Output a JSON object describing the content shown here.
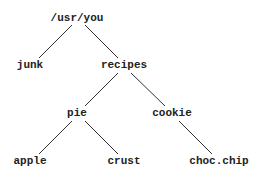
{
  "diagram": {
    "type": "tree",
    "colors": {
      "text": "#222222",
      "edge": "#333333",
      "background": "#ffffff"
    },
    "nodes": [
      {
        "id": "root",
        "label": "/usr/you",
        "x": 77,
        "y": 21
      },
      {
        "id": "junk",
        "label": "junk",
        "x": 30,
        "y": 68
      },
      {
        "id": "recipes",
        "label": "recipes",
        "x": 124,
        "y": 68
      },
      {
        "id": "pie",
        "label": "pie",
        "x": 77,
        "y": 116
      },
      {
        "id": "cookie",
        "label": "cookie",
        "x": 172,
        "y": 116
      },
      {
        "id": "apple",
        "label": "apple",
        "x": 30,
        "y": 164
      },
      {
        "id": "crust",
        "label": "crust",
        "x": 124,
        "y": 164
      },
      {
        "id": "chocchip",
        "label": "choc.chip",
        "x": 219,
        "y": 164
      }
    ],
    "edges": [
      {
        "from": "root",
        "to": "junk",
        "x1": 72,
        "y1": 25,
        "x2": 39,
        "y2": 58
      },
      {
        "from": "root",
        "to": "recipes",
        "x1": 85,
        "y1": 25,
        "x2": 118,
        "y2": 58
      },
      {
        "from": "recipes",
        "to": "pie",
        "x1": 118,
        "y1": 73,
        "x2": 85,
        "y2": 106
      },
      {
        "from": "recipes",
        "to": "cookie",
        "x1": 131,
        "y1": 73,
        "x2": 165,
        "y2": 106
      },
      {
        "from": "pie",
        "to": "apple",
        "x1": 72,
        "y1": 121,
        "x2": 39,
        "y2": 154
      },
      {
        "from": "pie",
        "to": "crust",
        "x1": 85,
        "y1": 121,
        "x2": 118,
        "y2": 154
      },
      {
        "from": "cookie",
        "to": "chocchip",
        "x1": 179,
        "y1": 121,
        "x2": 212,
        "y2": 154
      }
    ]
  }
}
